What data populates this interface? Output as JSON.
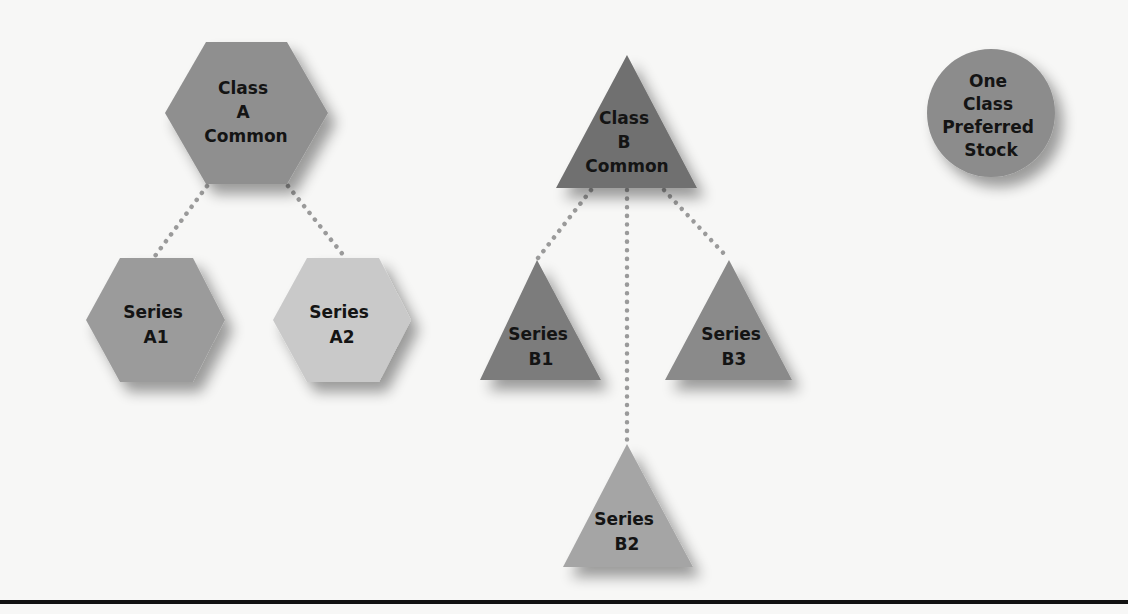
{
  "diagram": {
    "nodes": {
      "class_a": {
        "lines": [
          "Class",
          "A",
          "Common"
        ],
        "shape": "hexagon",
        "color": "#8f8f8f"
      },
      "class_b": {
        "lines": [
          "Class",
          "B",
          "Common"
        ],
        "shape": "triangle",
        "color": "#6f6f6f"
      },
      "preferred": {
        "lines": [
          "One",
          "Class",
          "Preferred",
          "Stock"
        ],
        "shape": "circle",
        "color": "#8c8c8c"
      },
      "series_a1": {
        "lines": [
          "Series",
          "A1"
        ],
        "shape": "hexagon",
        "color": "#9b9b9b"
      },
      "series_a2": {
        "lines": [
          "Series",
          "A2"
        ],
        "shape": "hexagon",
        "color": "#c9c9c9"
      },
      "series_b1": {
        "lines": [
          "Series",
          "B1"
        ],
        "shape": "triangle",
        "color": "#7b7b7b"
      },
      "series_b2": {
        "lines": [
          "Series",
          "B2"
        ],
        "shape": "triangle",
        "color": "#a5a5a5"
      },
      "series_b3": {
        "lines": [
          "Series",
          "B3"
        ],
        "shape": "triangle",
        "color": "#8a8a8a"
      }
    },
    "edges": [
      {
        "from": "class_a",
        "to": "series_a1",
        "style": "dotted"
      },
      {
        "from": "class_a",
        "to": "series_a2",
        "style": "dotted"
      },
      {
        "from": "class_b",
        "to": "series_b1",
        "style": "dotted"
      },
      {
        "from": "class_b",
        "to": "series_b2",
        "style": "dotted"
      },
      {
        "from": "class_b",
        "to": "series_b3",
        "style": "dotted"
      }
    ],
    "colors": {
      "background": "#f7f7f6",
      "connector": "#9a9a9a",
      "rule": "#111111",
      "text": "#141414"
    }
  }
}
